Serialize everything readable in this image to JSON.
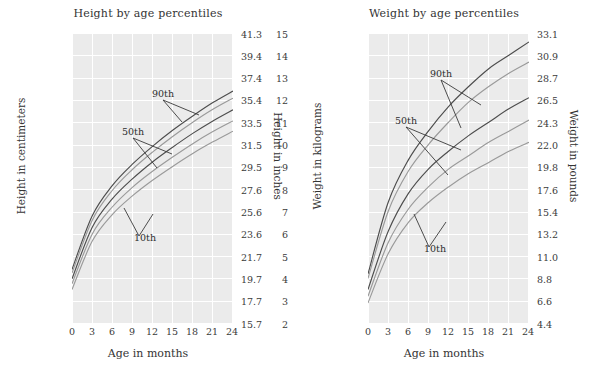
{
  "figure": {
    "background": "#ffffff",
    "plot_background": "#ebebeb",
    "grid_color": "#ffffff",
    "text_color": "#3a3a3a"
  },
  "charts": [
    {
      "id": "height-by-age",
      "title": "Height by age percentiles",
      "xlabel": "Age in months",
      "ylabel_left": "Height in centimeters",
      "ylabel_right": "Height in inches",
      "xticks": [
        "0",
        "3",
        "6",
        "9",
        "12",
        "15",
        "18",
        "21",
        "24"
      ],
      "yticks_left": [
        "105",
        "100",
        "95",
        "90",
        "85",
        "80",
        "75",
        "70",
        "65",
        "60",
        "55",
        "50",
        "45",
        "40"
      ],
      "yticks_right": [
        "41.3",
        "39.4",
        "37.4",
        "35.4",
        "33.5",
        "31.5",
        "29.5",
        "27.6",
        "25.6",
        "23.6",
        "21.7",
        "19.7",
        "17.7",
        "15.7"
      ],
      "annotations": [
        {
          "label": "90th"
        },
        {
          "label": "50th"
        },
        {
          "label": "10th"
        }
      ]
    },
    {
      "id": "weight-by-age",
      "title": "Weight by age percentiles",
      "xlabel": "Age in months",
      "ylabel_left": "Weight in kilograms",
      "ylabel_right": "Weight in pounds",
      "xticks": [
        "0",
        "3",
        "6",
        "9",
        "12",
        "15",
        "18",
        "21",
        "24"
      ],
      "yticks_left": [
        "15",
        "14",
        "13",
        "12",
        "11",
        "10",
        "9",
        "8",
        "7",
        "6",
        "5",
        "4",
        "3",
        "2"
      ],
      "yticks_right": [
        "33.1",
        "30.9",
        "28.7",
        "26.5",
        "24.3",
        "22.0",
        "19.8",
        "17.6",
        "15.4",
        "13.2",
        "11.0",
        "8.8",
        "6.6",
        "4.4"
      ],
      "annotations": [
        {
          "label": "90th"
        },
        {
          "label": "50th"
        },
        {
          "label": "10th"
        }
      ]
    }
  ],
  "chart_data": [
    {
      "type": "line",
      "id": "height-by-age",
      "title": "Height by age percentiles",
      "xlabel": "Age in months",
      "ylabel": "Height in centimeters",
      "ylabel_secondary": "Height in inches",
      "x": [
        0,
        3,
        6,
        9,
        12,
        15,
        18,
        21,
        24
      ],
      "xlim": [
        0,
        24
      ],
      "ylim": [
        40,
        105
      ],
      "ylim_secondary": [
        15.7,
        41.3
      ],
      "grid": true,
      "legend": "inline-annotations",
      "series": [
        {
          "name": "95th",
          "color": "#4d4d4d",
          "values": [
            52.0,
            64.0,
            70.8,
            75.6,
            79.6,
            83.2,
            86.4,
            89.4,
            92.0
          ]
        },
        {
          "name": "90th",
          "color": "#9a9a9a",
          "values": [
            51.2,
            63.0,
            69.7,
            74.4,
            78.3,
            81.8,
            85.0,
            87.9,
            90.4
          ]
        },
        {
          "name": "50th",
          "color": "#4d4d4d",
          "values": [
            49.9,
            61.4,
            67.8,
            72.3,
            76.1,
            79.4,
            82.5,
            85.3,
            87.8
          ]
        },
        {
          "name": "25th",
          "color": "#9a9a9a",
          "values": [
            48.8,
            59.9,
            66.0,
            70.4,
            74.0,
            77.2,
            80.2,
            82.9,
            85.3
          ]
        },
        {
          "name": "10th",
          "color": "#9a9a9a",
          "values": [
            47.5,
            58.3,
            64.3,
            68.5,
            72.0,
            75.1,
            78.0,
            80.6,
            83.0
          ]
        }
      ]
    },
    {
      "type": "line",
      "id": "weight-by-age",
      "title": "Weight by age percentiles",
      "xlabel": "Age in months",
      "ylabel": "Weight in kilograms",
      "ylabel_secondary": "Weight in pounds",
      "x": [
        0,
        3,
        6,
        9,
        12,
        15,
        18,
        21,
        24
      ],
      "xlim": [
        0,
        24
      ],
      "ylim": [
        2,
        15
      ],
      "ylim_secondary": [
        4.4,
        33.1
      ],
      "grid": true,
      "legend": "inline-annotations",
      "series": [
        {
          "name": "95th",
          "color": "#4d4d4d",
          "values": [
            4.2,
            7.4,
            9.3,
            10.6,
            11.7,
            12.6,
            13.4,
            14.0,
            14.6
          ]
        },
        {
          "name": "90th",
          "color": "#9a9a9a",
          "values": [
            4.0,
            7.0,
            8.8,
            10.0,
            11.0,
            11.9,
            12.6,
            13.2,
            13.7
          ]
        },
        {
          "name": "50th",
          "color": "#4d4d4d",
          "values": [
            3.5,
            6.1,
            7.8,
            8.9,
            9.7,
            10.4,
            11.0,
            11.6,
            12.1
          ]
        },
        {
          "name": "25th",
          "color": "#9a9a9a",
          "values": [
            3.2,
            5.6,
            7.1,
            8.1,
            8.9,
            9.5,
            10.1,
            10.6,
            11.1
          ]
        },
        {
          "name": "10th",
          "color": "#9a9a9a",
          "values": [
            2.9,
            5.1,
            6.5,
            7.4,
            8.1,
            8.7,
            9.2,
            9.7,
            10.1
          ]
        }
      ]
    }
  ]
}
